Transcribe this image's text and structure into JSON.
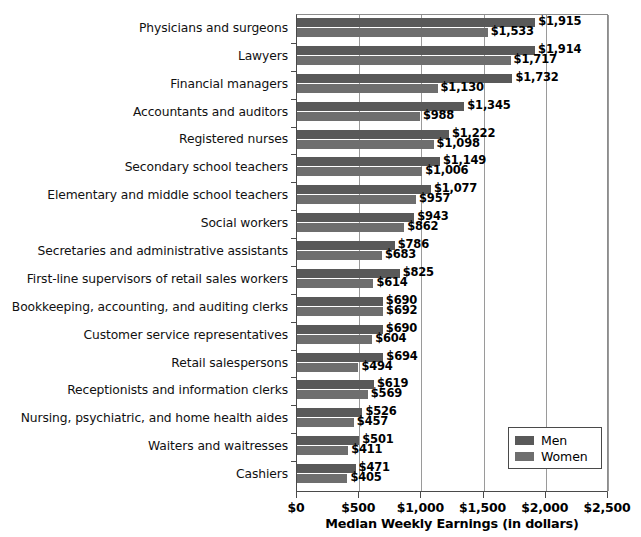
{
  "chart_data": {
    "type": "bar",
    "orientation": "horizontal",
    "title": "",
    "xlabel": "Median Weekly Earnings (in dollars)",
    "ylabel": "",
    "xlim": [
      0,
      2500
    ],
    "xticks": [
      "$0",
      "$500",
      "$1,000",
      "$1,500",
      "$2,000",
      "$2,500"
    ],
    "xtick_values": [
      0,
      500,
      1000,
      1500,
      2000,
      2500
    ],
    "grid": "vertical",
    "legend_position": "bottom-right",
    "categories": [
      "Physicians and surgeons",
      "Lawyers",
      "Financial managers",
      "Accountants and auditors",
      "Registered nurses",
      "Secondary school teachers",
      "Elementary and middle school teachers",
      "Social workers",
      "Secretaries and administrative assistants",
      "First-line supervisors of retail sales workers",
      "Bookkeeping, accounting, and auditing clerks",
      "Customer service representatives",
      "Retail salespersons",
      "Receptionists and information clerks",
      "Nursing, psychiatric, and home health aides",
      "Waiters and waitresses",
      "Cashiers"
    ],
    "series": [
      {
        "name": "Men",
        "color": "#595959",
        "values": [
          1915,
          1914,
          1732,
          1345,
          1222,
          1149,
          1077,
          943,
          786,
          825,
          690,
          690,
          694,
          619,
          526,
          501,
          471
        ],
        "labels": [
          "$1,915",
          "$1,914",
          "$1,732",
          "$1,345",
          "$1,222",
          "$1,149",
          "$1,077",
          "$943",
          "$786",
          "$825",
          "$690",
          "$690",
          "$694",
          "$619",
          "$526",
          "$501",
          "$471"
        ]
      },
      {
        "name": "Women",
        "color": "#6e6e6e",
        "values": [
          1533,
          1717,
          1130,
          988,
          1098,
          1006,
          957,
          862,
          683,
          614,
          692,
          604,
          494,
          569,
          457,
          411,
          405
        ],
        "labels": [
          "$1,533",
          "$1,717",
          "$1,130",
          "$988",
          "$1,098",
          "$1,006",
          "$957",
          "$862",
          "$683",
          "$614",
          "$692",
          "$604",
          "$494",
          "$569",
          "$457",
          "$411",
          "$405"
        ]
      }
    ]
  },
  "legend": {
    "items": [
      {
        "label": "Men",
        "color": "#595959"
      },
      {
        "label": "Women",
        "color": "#6e6e6e"
      }
    ]
  }
}
